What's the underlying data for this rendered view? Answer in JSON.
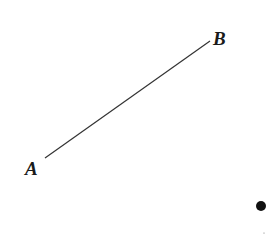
{
  "diagram": {
    "points": [
      {
        "label": "A",
        "x": 45,
        "y": 158
      },
      {
        "label": "B",
        "x": 210,
        "y": 41
      }
    ],
    "segment": {
      "from": "A",
      "to": "B"
    },
    "dot": {
      "x": 261,
      "y": 206,
      "r": 5
    },
    "colors": {
      "line": "#333333",
      "text": "#1a1a1a",
      "dot": "#111111"
    }
  }
}
